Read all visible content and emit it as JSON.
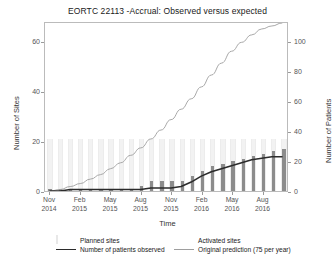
{
  "chart_data": {
    "type": "bar",
    "title": "EORTC 22113 -Accrual: Observed versus expected",
    "xlabel": "Time",
    "ylabel": "Number of Sites",
    "y2label": "Number of Patients",
    "ylim": [
      0,
      68
    ],
    "y2lim": [
      0,
      113
    ],
    "grid": false,
    "legend_position": "bottom",
    "yticks": [
      "0",
      "20",
      "40",
      "60"
    ],
    "ytick_values": [
      0,
      20,
      40,
      60
    ],
    "y2ticks": [
      "0",
      "20",
      "40",
      "60",
      "80",
      "100"
    ],
    "y2tick_values": [
      0,
      20,
      40,
      60,
      80,
      100
    ],
    "xticks": [
      {
        "month": "Nov",
        "year": "2014"
      },
      {
        "month": "Feb",
        "year": "2015"
      },
      {
        "month": "May",
        "year": "2015"
      },
      {
        "month": "Aug",
        "year": "2015"
      },
      {
        "month": "Nov",
        "year": "2015"
      },
      {
        "month": "Feb",
        "year": "2016"
      },
      {
        "month": "May",
        "year": "2016"
      },
      {
        "month": "Aug",
        "year": "2016"
      }
    ],
    "x": [
      "Nov 2014",
      "Dec 2014",
      "Jan 2015",
      "Feb 2015",
      "Mar 2015",
      "Apr 2015",
      "May 2015",
      "Jun 2015",
      "Jul 2015",
      "Aug 2015",
      "Sep 2015",
      "Oct 2015",
      "Nov 2015",
      "Dec 2015",
      "Jan 2016",
      "Feb 2016",
      "Mar 2016",
      "Apr 2016",
      "May 2016",
      "Jun 2016",
      "Jul 2016",
      "Aug 2016",
      "Sep 2016",
      "Oct 2016"
    ],
    "series": [
      {
        "name": "Planned sites",
        "type": "bar",
        "axis": "left",
        "color": "#f2f2f2",
        "values": [
          21,
          21,
          21,
          21,
          21,
          21,
          21,
          21,
          21,
          21,
          21,
          21,
          21,
          21,
          21,
          21,
          21,
          21,
          21,
          21,
          21,
          21,
          21,
          21
        ]
      },
      {
        "name": "Activated sites",
        "type": "bar",
        "axis": "left",
        "color": "#8c8c8c",
        "values": [
          1,
          1,
          1,
          1,
          1,
          1,
          1,
          1,
          1,
          2,
          4,
          4,
          4,
          4,
          6,
          8,
          10,
          11,
          12,
          13,
          14,
          15,
          16,
          17
        ]
      },
      {
        "name": "Number of patients observed",
        "type": "line",
        "axis": "right",
        "color": "#2b2b2b",
        "values": [
          0,
          0,
          1,
          1,
          1,
          1,
          1,
          1,
          1,
          1,
          2,
          2,
          2,
          3,
          6,
          10,
          13,
          15,
          17,
          19,
          21,
          22,
          23,
          23
        ]
      },
      {
        "name": "Original prediction (75 per year)",
        "type": "line",
        "axis": "right",
        "color": "#9e9e9e",
        "values": [
          0,
          1,
          3,
          5,
          8,
          11,
          15,
          19,
          24,
          29,
          35,
          41,
          48,
          55,
          62,
          70,
          78,
          86,
          94,
          100,
          105,
          109,
          111,
          113
        ]
      }
    ]
  },
  "legend": {
    "items": [
      {
        "label": "Planned sites",
        "key": "planned-square-swatch"
      },
      {
        "label": "Activated sites",
        "key": "activated-square-swatch"
      },
      {
        "label": "Number of patients observed",
        "key": "dark-line-swatch"
      },
      {
        "label": "Original prediction (75 per year)",
        "key": "grey-line-swatch"
      }
    ]
  },
  "colors": {
    "planned": "#f2f2f2",
    "activated": "#8c8c8c",
    "observed_line": "#2b2b2b",
    "prediction_line": "#9e9e9e",
    "frame": "#bbbbbb",
    "text": "#333333"
  }
}
